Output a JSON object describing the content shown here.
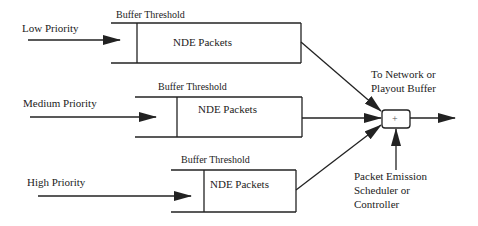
{
  "diagram": {
    "queues": [
      {
        "priority": "Low Priority",
        "threshold_label": "Buffer Threshold",
        "content_label": "NDE Packets"
      },
      {
        "priority": "Medium Priority",
        "threshold_label": "Buffer Threshold",
        "content_label": "NDE Packets"
      },
      {
        "priority": "High Priority",
        "threshold_label": "Buffer Threshold",
        "content_label": "NDE Packets"
      }
    ],
    "combiner": {
      "symbol": "+"
    },
    "output_label": {
      "line1": "To Network  or",
      "line2": "Playout Buffer"
    },
    "scheduler_label": {
      "line1": "Packet Emission",
      "line2": "Scheduler or",
      "line3": "Controller"
    },
    "colors": {
      "stroke": "#222222",
      "background": "#ffffff"
    }
  }
}
